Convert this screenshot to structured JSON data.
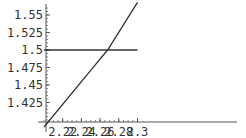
{
  "chart_data": {
    "type": "line",
    "title": "",
    "xlabel": "",
    "ylabel": "",
    "xlim": [
      2.2,
      2.3
    ],
    "ylim": [
      1.4,
      1.56
    ],
    "grid": false,
    "legend": null,
    "x_ticks": [
      "2.22",
      "2.24",
      "2.26",
      "2.28",
      "2.3"
    ],
    "x_tick_values": [
      2.22,
      2.24,
      2.26,
      2.28,
      2.3
    ],
    "y_ticks": [
      "1.55",
      "1.525",
      "1.5",
      "1.475",
      "1.45",
      "1.425"
    ],
    "y_tick_values": [
      1.55,
      1.525,
      1.5,
      1.475,
      1.45,
      1.425
    ],
    "series": [
      {
        "name": "increasing-curve",
        "x": [
          2.2,
          2.25,
          2.268,
          2.3
        ],
        "y": [
          1.39,
          1.471,
          1.5,
          1.568
        ]
      },
      {
        "name": "horizontal-line",
        "x": [
          2.2,
          2.3
        ],
        "y": [
          1.5,
          1.5
        ]
      }
    ],
    "annotations": [
      {
        "type": "intersection",
        "x": 2.268,
        "y": 1.5
      }
    ]
  },
  "colors": {
    "line": "#333333",
    "axis": "#555555",
    "text": "#333333",
    "background": "#ffffff"
  }
}
